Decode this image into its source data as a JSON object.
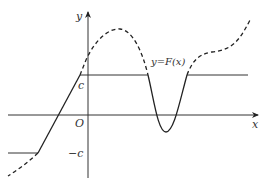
{
  "diagram": {
    "axes": {
      "x_label": "x",
      "y_label": "y",
      "origin_label": "O"
    },
    "levels": {
      "upper_label": "c",
      "lower_label": "−c"
    },
    "curve_label": "y=F(x)",
    "colors": {
      "stroke": "#222222",
      "background": "#ffffff"
    }
  }
}
